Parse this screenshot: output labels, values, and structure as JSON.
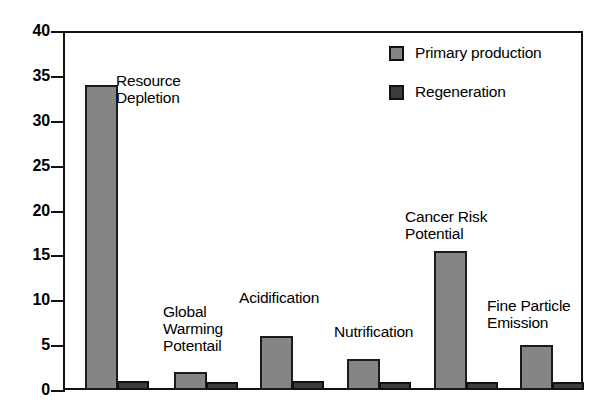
{
  "chart_data": {
    "type": "bar",
    "title": "",
    "xlabel": "",
    "ylabel": "",
    "ylim": [
      0,
      40
    ],
    "ytick_step": 5,
    "grid": true,
    "legend_position": "top-right",
    "categories": [
      "Resource\nDepletion",
      "Global\nWarming\nPotentail",
      "Acidification",
      "Nutrification",
      "Cancer Risk\nPotential",
      "Fine Particle\nEmission"
    ],
    "yticks": [
      "40",
      "35",
      "30",
      "25",
      "20",
      "15",
      "10",
      "5",
      "0"
    ],
    "series": [
      {
        "name": "Primary production",
        "color": "#858585",
        "values": [
          34.0,
          2.0,
          6.0,
          3.5,
          15.5,
          5.0
        ]
      },
      {
        "name": "Regeneration",
        "color": "#3d3d3d",
        "values": [
          1.0,
          0.9,
          1.0,
          0.9,
          0.9,
          0.9
        ]
      }
    ]
  },
  "legend": {
    "items": [
      {
        "label": "Primary production",
        "swatch": "primary-production-swatch"
      },
      {
        "label": "Regeneration",
        "swatch": "regeneration-swatch"
      }
    ]
  },
  "axis": {
    "y_labels": [
      "40",
      "35",
      "30",
      "25",
      "20",
      "15",
      "10",
      "5",
      "0"
    ]
  }
}
